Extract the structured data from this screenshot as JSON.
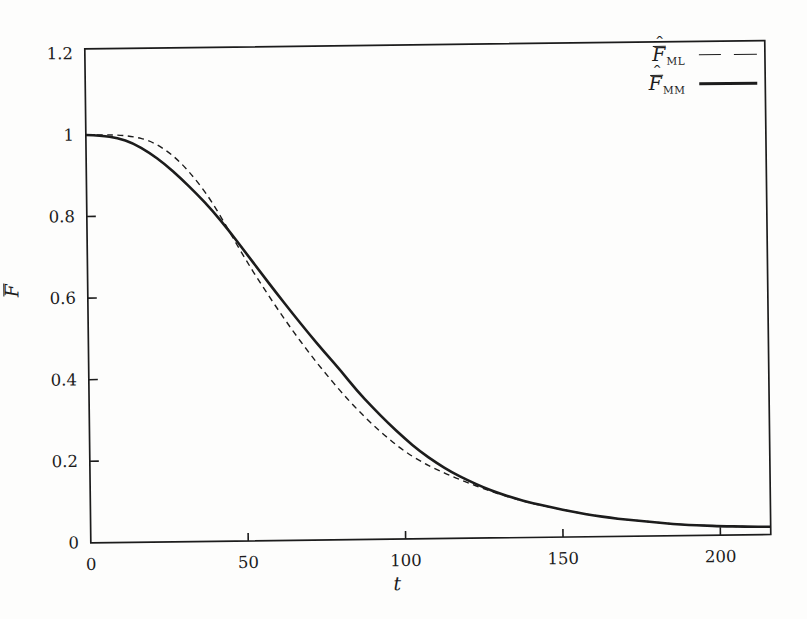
{
  "figure": {
    "background": "#fdfdfc",
    "ink": "#1c1c1c",
    "kind": "scanned line plot of two estimated survivor functions"
  },
  "chart_data": {
    "type": "line",
    "title": "",
    "xlabel": "t",
    "ylabel": {
      "base": "F",
      "accents": [
        "bar",
        "hat"
      ],
      "hat_char": "ˆ"
    },
    "grid": false,
    "legend_position": "top-right-inside",
    "x_axis": {
      "min": 0,
      "max": 216,
      "ticks": [
        {
          "value": 0,
          "label": "0"
        },
        {
          "value": 50,
          "label": "50"
        },
        {
          "value": 100,
          "label": "100"
        },
        {
          "value": 150,
          "label": "150"
        },
        {
          "value": 200,
          "label": "200"
        }
      ]
    },
    "y_axis": {
      "min": 0,
      "max": 1.211,
      "ticks": [
        {
          "value": 0,
          "label": "0"
        },
        {
          "value": 0.2,
          "label": "0.2"
        },
        {
          "value": 0.4,
          "label": "0.4"
        },
        {
          "value": 0.6,
          "label": "0.6"
        },
        {
          "value": 0.8,
          "label": "0.8"
        },
        {
          "value": 1,
          "label": "1"
        },
        {
          "value": 1.2,
          "label": "1.2"
        }
      ]
    },
    "legend": {
      "entries": [
        {
          "base": "F",
          "accents": [
            "bar",
            "hat"
          ],
          "hat_char": "ˆ",
          "subscript": "ML",
          "line_style": "dashed"
        },
        {
          "base": "F",
          "accents": [
            "bar",
            "hat"
          ],
          "hat_char": "ˆ",
          "subscript": "MM",
          "line_style": "solid"
        }
      ]
    },
    "series": [
      {
        "name": "F_ML",
        "line_style": "dashed",
        "stroke_width": 1.4,
        "dash": [
          6,
          4.5
        ],
        "points": [
          [
            0,
            1.0
          ],
          [
            5,
            1.0
          ],
          [
            10,
            0.999
          ],
          [
            15,
            0.995
          ],
          [
            20,
            0.985
          ],
          [
            25,
            0.963
          ],
          [
            30,
            0.93
          ],
          [
            35,
            0.885
          ],
          [
            40,
            0.83
          ],
          [
            45,
            0.762
          ],
          [
            50,
            0.693
          ],
          [
            55,
            0.63
          ],
          [
            60,
            0.57
          ],
          [
            65,
            0.513
          ],
          [
            70,
            0.46
          ],
          [
            75,
            0.41
          ],
          [
            80,
            0.363
          ],
          [
            85,
            0.32
          ],
          [
            90,
            0.281
          ],
          [
            95,
            0.246
          ],
          [
            100,
            0.215
          ],
          [
            105,
            0.19
          ],
          [
            110,
            0.17
          ],
          [
            115,
            0.152
          ],
          [
            120,
            0.136
          ],
          [
            125,
            0.121
          ],
          [
            130,
            0.107
          ],
          [
            135,
            0.095
          ],
          [
            140,
            0.084
          ],
          [
            145,
            0.075
          ],
          [
            150,
            0.067
          ],
          [
            155,
            0.059
          ],
          [
            160,
            0.052
          ],
          [
            165,
            0.046
          ],
          [
            170,
            0.041
          ],
          [
            175,
            0.037
          ],
          [
            180,
            0.033
          ],
          [
            185,
            0.029
          ],
          [
            190,
            0.026
          ],
          [
            195,
            0.024
          ],
          [
            200,
            0.022
          ],
          [
            208,
            0.02
          ],
          [
            216,
            0.019
          ]
        ]
      },
      {
        "name": "F_MM",
        "line_style": "solid",
        "stroke_width": 2.6,
        "dash": null,
        "points": [
          [
            0,
            1.0
          ],
          [
            5,
            0.998
          ],
          [
            10,
            0.992
          ],
          [
            15,
            0.978
          ],
          [
            20,
            0.955
          ],
          [
            25,
            0.926
          ],
          [
            30,
            0.891
          ],
          [
            35,
            0.852
          ],
          [
            40,
            0.81
          ],
          [
            45,
            0.762
          ],
          [
            50,
            0.71
          ],
          [
            55,
            0.658
          ],
          [
            60,
            0.606
          ],
          [
            65,
            0.556
          ],
          [
            70,
            0.507
          ],
          [
            75,
            0.46
          ],
          [
            80,
            0.415
          ],
          [
            85,
            0.366
          ],
          [
            90,
            0.324
          ],
          [
            95,
            0.284
          ],
          [
            100,
            0.247
          ],
          [
            105,
            0.214
          ],
          [
            110,
            0.186
          ],
          [
            115,
            0.162
          ],
          [
            120,
            0.142
          ],
          [
            125,
            0.124
          ],
          [
            130,
            0.109
          ],
          [
            135,
            0.096
          ],
          [
            140,
            0.085
          ],
          [
            145,
            0.076
          ],
          [
            150,
            0.067
          ],
          [
            155,
            0.059
          ],
          [
            160,
            0.052
          ],
          [
            165,
            0.046
          ],
          [
            170,
            0.041
          ],
          [
            175,
            0.037
          ],
          [
            180,
            0.033
          ],
          [
            185,
            0.029
          ],
          [
            190,
            0.026
          ],
          [
            195,
            0.024
          ],
          [
            200,
            0.022
          ],
          [
            208,
            0.02
          ],
          [
            216,
            0.019
          ]
        ]
      }
    ],
    "plot_box_px": {
      "left": 88,
      "top": 45,
      "right": 768,
      "bottom": 539
    }
  }
}
